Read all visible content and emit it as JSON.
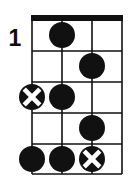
{
  "diagram": {
    "kind": "chord-diagram",
    "instrument_strings": 4,
    "fret_number_label": "1",
    "colors": {
      "ink": "#111111",
      "paper": "#ffffff",
      "x_mark": "#ffffff"
    },
    "geometry": {
      "grid_left": 32,
      "grid_right": 122,
      "grid_top": 20,
      "grid_bottom": 174,
      "string_x": [
        32,
        62,
        92,
        122
      ],
      "fret_y": [
        20,
        51,
        82,
        113,
        144,
        174
      ],
      "nut_thickness": 5,
      "dot_radius": 13,
      "x_circle_radius": 13
    },
    "nut": {
      "present": true,
      "label": "nut"
    },
    "strings": [
      {
        "index": 1,
        "label": "string-1",
        "x": 32
      },
      {
        "index": 2,
        "label": "string-2",
        "x": 62
      },
      {
        "index": 3,
        "label": "string-3",
        "x": 92
      },
      {
        "index": 4,
        "label": "string-4",
        "x": 122
      }
    ],
    "frets": [
      {
        "index": 1,
        "label": "fret-1",
        "y_center": 35
      },
      {
        "index": 2,
        "label": "fret-2",
        "y_center": 66
      },
      {
        "index": 3,
        "label": "fret-3",
        "y_center": 97
      },
      {
        "index": 4,
        "label": "fret-4",
        "y_center": 128
      },
      {
        "index": 5,
        "label": "fret-5",
        "y_center": 159
      }
    ],
    "markers": [
      {
        "id": "m1",
        "type": "filled-dot",
        "string": 2,
        "fret": 1,
        "cx": 62,
        "cy": 35,
        "label": "root-note"
      },
      {
        "id": "m2",
        "type": "filled-dot",
        "string": 3,
        "fret": 2,
        "cx": 92,
        "cy": 66,
        "label": "note"
      },
      {
        "id": "m3",
        "type": "x-circle",
        "string": 1,
        "fret": 3,
        "cx": 32,
        "cy": 97,
        "label": "marked-note"
      },
      {
        "id": "m4",
        "type": "filled-dot",
        "string": 2,
        "fret": 3,
        "cx": 62,
        "cy": 97,
        "label": "note"
      },
      {
        "id": "m5",
        "type": "filled-dot",
        "string": 3,
        "fret": 4,
        "cx": 92,
        "cy": 128,
        "label": "note"
      },
      {
        "id": "m6",
        "type": "filled-dot",
        "string": 1,
        "fret": 5,
        "cx": 32,
        "cy": 159,
        "label": "note"
      },
      {
        "id": "m7",
        "type": "filled-dot",
        "string": 2,
        "fret": 5,
        "cx": 62,
        "cy": 159,
        "label": "note"
      },
      {
        "id": "m8",
        "type": "x-circle",
        "string": 3,
        "fret": 5,
        "cx": 92,
        "cy": 159,
        "label": "marked-note"
      }
    ]
  }
}
